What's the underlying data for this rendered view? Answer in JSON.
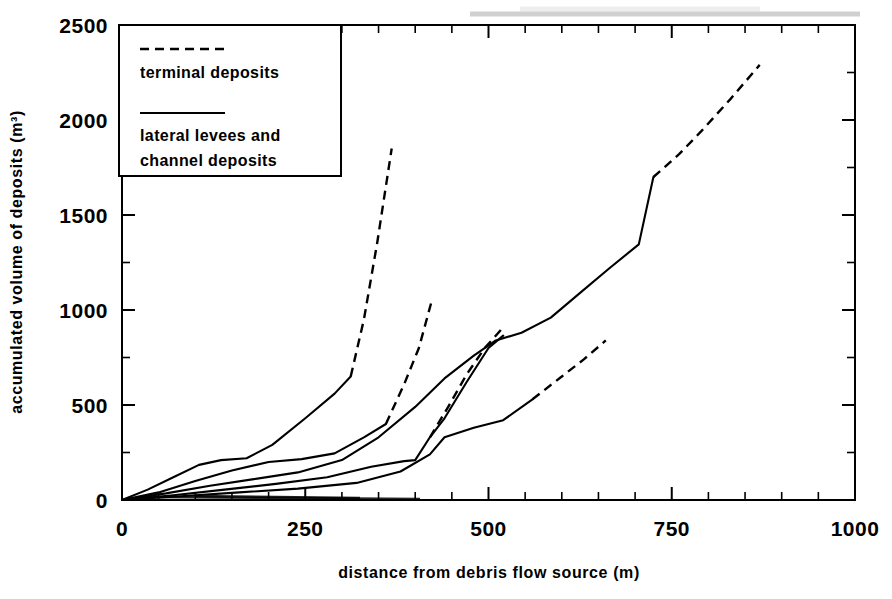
{
  "figure": {
    "background_color": "#ffffff",
    "ink_color": "#000000"
  },
  "chart_data": {
    "type": "line",
    "title": "",
    "subtitle": "",
    "xlabel": "distance from debris flow source (m)",
    "ylabel": "accumulated volume of deposits (m3)",
    "ylabel_display": "accumulated volume of deposits (m³)",
    "xlim": [
      0,
      1000
    ],
    "ylim": [
      0,
      2500
    ],
    "xticks": [
      0,
      250,
      500,
      750,
      1000
    ],
    "xtick_labels": [
      "0",
      "250",
      "500",
      "750",
      "1000"
    ],
    "xticks_minor_step": 50,
    "yticks": [
      0,
      500,
      1000,
      1500,
      2000,
      2500
    ],
    "ytick_labels": [
      "0",
      "500",
      "1000",
      "1500",
      "2000",
      "2500"
    ],
    "yticks_minor_step": 250,
    "grid": false,
    "legend_position": "upper-left-inside",
    "legend": [
      {
        "key": "terminal",
        "style": "dashed",
        "label": "terminal deposits"
      },
      {
        "key": "lateral",
        "style": "solid",
        "label_line1": "lateral levees and",
        "label_line2": "channel deposits"
      }
    ],
    "series": [
      {
        "name": "flow-1-channel",
        "style": "solid",
        "legend_key": "lateral",
        "points": [
          [
            0,
            0
          ],
          [
            35,
            55
          ],
          [
            70,
            120
          ],
          [
            105,
            185
          ],
          [
            135,
            210
          ],
          [
            170,
            220
          ],
          [
            205,
            290
          ],
          [
            250,
            430
          ],
          [
            290,
            560
          ],
          [
            312,
            650
          ]
        ]
      },
      {
        "name": "flow-1-terminal",
        "style": "dashed",
        "legend_key": "terminal",
        "points": [
          [
            312,
            650
          ],
          [
            330,
            950
          ],
          [
            348,
            1350
          ],
          [
            368,
            1850
          ]
        ]
      },
      {
        "name": "flow-2-channel",
        "style": "solid",
        "legend_key": "lateral",
        "points": [
          [
            0,
            0
          ],
          [
            50,
            40
          ],
          [
            100,
            100
          ],
          [
            150,
            155
          ],
          [
            200,
            200
          ],
          [
            245,
            215
          ],
          [
            290,
            245
          ],
          [
            330,
            330
          ],
          [
            360,
            400
          ]
        ]
      },
      {
        "name": "flow-2-terminal",
        "style": "dashed",
        "legend_key": "terminal",
        "points": [
          [
            360,
            400
          ],
          [
            385,
            610
          ],
          [
            405,
            800
          ],
          [
            422,
            1040
          ]
        ]
      },
      {
        "name": "flow-3-channel",
        "style": "solid",
        "legend_key": "lateral",
        "points": [
          [
            0,
            0
          ],
          [
            60,
            35
          ],
          [
            120,
            75
          ],
          [
            180,
            110
          ],
          [
            240,
            145
          ],
          [
            300,
            210
          ],
          [
            350,
            330
          ],
          [
            400,
            490
          ],
          [
            440,
            640
          ],
          [
            480,
            760
          ],
          [
            510,
            840
          ],
          [
            545,
            880
          ],
          [
            585,
            960
          ],
          [
            625,
            1090
          ],
          [
            665,
            1220
          ],
          [
            705,
            1345
          ],
          [
            725,
            1700
          ]
        ]
      },
      {
        "name": "flow-3-terminal",
        "style": "dashed",
        "legend_key": "terminal",
        "points": [
          [
            725,
            1700
          ],
          [
            760,
            1820
          ],
          [
            790,
            1940
          ],
          [
            830,
            2110
          ],
          [
            870,
            2290
          ]
        ]
      },
      {
        "name": "flow-4-channel",
        "style": "solid",
        "legend_key": "lateral",
        "points": [
          [
            0,
            0
          ],
          [
            70,
            25
          ],
          [
            140,
            55
          ],
          [
            210,
            85
          ],
          [
            280,
            120
          ],
          [
            340,
            175
          ],
          [
            385,
            205
          ],
          [
            400,
            210
          ],
          [
            420,
            330
          ],
          [
            440,
            430
          ],
          [
            470,
            620
          ],
          [
            500,
            800
          ],
          [
            520,
            865
          ]
        ]
      },
      {
        "name": "flow-4-terminal",
        "style": "dashed",
        "legend_key": "terminal",
        "points": [
          [
            420,
            330
          ],
          [
            445,
            490
          ],
          [
            470,
            660
          ],
          [
            495,
            800
          ],
          [
            518,
            900
          ]
        ]
      },
      {
        "name": "flow-5-channel",
        "style": "solid",
        "legend_key": "lateral",
        "points": [
          [
            0,
            0
          ],
          [
            80,
            20
          ],
          [
            160,
            40
          ],
          [
            240,
            60
          ],
          [
            320,
            90
          ],
          [
            380,
            150
          ],
          [
            420,
            240
          ],
          [
            440,
            330
          ],
          [
            480,
            380
          ],
          [
            520,
            420
          ],
          [
            560,
            530
          ]
        ]
      },
      {
        "name": "flow-5-terminal",
        "style": "dashed",
        "legend_key": "terminal",
        "points": [
          [
            560,
            530
          ],
          [
            600,
            650
          ],
          [
            630,
            740
          ],
          [
            660,
            840
          ]
        ]
      }
    ]
  },
  "legend_block": {
    "terminal_label": "terminal deposits",
    "lateral_label_line1": "lateral levees and",
    "lateral_label_line2": "channel deposits"
  },
  "axis_labels": {
    "x_title": "distance from debris flow source (m)",
    "y_title": "accumulated volume of deposits (m³)",
    "x_ticks": [
      "0",
      "250",
      "500",
      "750",
      "1000"
    ],
    "y_ticks": [
      "0",
      "500",
      "1000",
      "1500",
      "2000",
      "2500"
    ]
  }
}
